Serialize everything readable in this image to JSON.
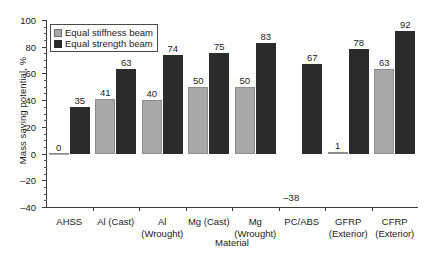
{
  "chart_data": {
    "type": "bar",
    "title": "",
    "xlabel": "Material",
    "ylabel": "Mass saving potential, %",
    "ylim": [
      -40,
      100
    ],
    "ytick_step": 20,
    "yticks": [
      -40,
      -20,
      0,
      20,
      40,
      60,
      80,
      100
    ],
    "ytick_labels": [
      "–40",
      "–20",
      "0",
      "20",
      "40",
      "60",
      "80",
      "100"
    ],
    "grid": false,
    "legend_position": "upper left",
    "categories": [
      "AHSS",
      "Al (Cast)",
      "Al (Wrought)",
      "Mg (Cast)",
      "Mg (Wrought)",
      "PC/ABS",
      "GFRP (Exterior)",
      "CFRP (Exterior)"
    ],
    "category_lines": [
      [
        "AHSS"
      ],
      [
        "Al (Cast)"
      ],
      [
        "Al",
        "(Wrought)"
      ],
      [
        "Mg (Cast)"
      ],
      [
        "Mg",
        "(Wrought)"
      ],
      [
        "PC/ABS"
      ],
      [
        "GFRP",
        "(Exterior)"
      ],
      [
        "CFRP",
        "(Exterior)"
      ]
    ],
    "series": [
      {
        "name": "Equal stiffness beam",
        "color": "#a9a9a9",
        "values": [
          0,
          41,
          40,
          50,
          50,
          -38,
          1,
          63
        ],
        "value_labels": [
          "0",
          "41",
          "40",
          "50",
          "50",
          "–38",
          "1",
          "63"
        ]
      },
      {
        "name": "Equal strength beam",
        "color": "#2b2b2b",
        "values": [
          35,
          63,
          74,
          75,
          83,
          67,
          78,
          92
        ],
        "value_labels": [
          "35",
          "63",
          "74",
          "75",
          "83",
          "67",
          "78",
          "92"
        ]
      }
    ]
  },
  "legend": {
    "items": [
      {
        "label": "Equal stiffness beam"
      },
      {
        "label": "Equal strength beam"
      }
    ]
  },
  "colors": {
    "stiffness": "#a9a9a9",
    "strength": "#2b2b2b",
    "axis": "#3a3a3a",
    "text": "#1a1a1a",
    "background": "#ffffff"
  }
}
